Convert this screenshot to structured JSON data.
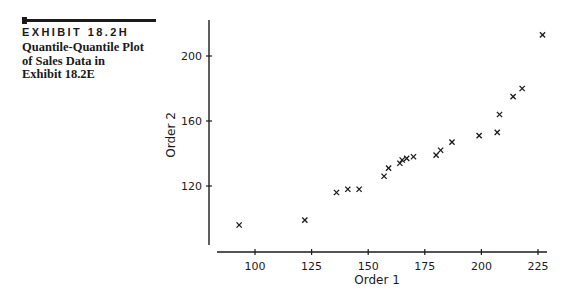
{
  "exhibit": {
    "label": "EXHIBIT 18.2H",
    "caption_lines": [
      "Quantile-Quantile Plot",
      "of Sales Data in",
      "Exhibit 18.2E"
    ]
  },
  "chart_data": {
    "type": "scatter",
    "title": "Quantile-Quantile Plot of Sales Data in Exhibit 18.2E",
    "xlabel": "Order 1",
    "ylabel": "Order 2",
    "marker": "x",
    "xlim": [
      84,
      230
    ],
    "ylim": [
      83,
      222
    ],
    "xticks": [
      100,
      125,
      150,
      175,
      200,
      225
    ],
    "yticks": [
      120,
      160,
      200
    ],
    "grid": false,
    "legend": null,
    "points": [
      {
        "x": 93,
        "y": 96
      },
      {
        "x": 122,
        "y": 99
      },
      {
        "x": 136,
        "y": 116
      },
      {
        "x": 141,
        "y": 118
      },
      {
        "x": 146,
        "y": 118
      },
      {
        "x": 157,
        "y": 126
      },
      {
        "x": 159,
        "y": 131
      },
      {
        "x": 164,
        "y": 134
      },
      {
        "x": 165,
        "y": 136
      },
      {
        "x": 167,
        "y": 137
      },
      {
        "x": 170,
        "y": 138
      },
      {
        "x": 180,
        "y": 139
      },
      {
        "x": 182,
        "y": 142
      },
      {
        "x": 187,
        "y": 147
      },
      {
        "x": 199,
        "y": 151
      },
      {
        "x": 207,
        "y": 153
      },
      {
        "x": 208,
        "y": 164
      },
      {
        "x": 214,
        "y": 175
      },
      {
        "x": 218,
        "y": 180
      },
      {
        "x": 227,
        "y": 213
      }
    ]
  }
}
